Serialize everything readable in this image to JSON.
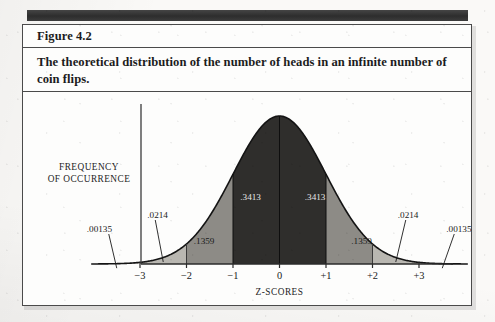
{
  "figure": {
    "title": "Figure 4.2",
    "caption": "The theoretical distribution of the number of heads in an infinite number of coin flips."
  },
  "chart_data": {
    "type": "area",
    "title": "The theoretical distribution of the number of heads in an infinite number of coin flips.",
    "xlabel": "Z-SCORES",
    "ylabel": "FREQUENCY OF OCCURRENCE",
    "ylabel_lines": [
      "FREQUENCY",
      "OF OCCURRENCE"
    ],
    "xlim": [
      -4,
      4
    ],
    "ylim": [
      0,
      0.42
    ],
    "grid": false,
    "legend": null,
    "distribution": "standard normal",
    "x_ticks": [
      "−3",
      "−2",
      "−1",
      "0",
      "+1",
      "+2",
      "+3"
    ],
    "x_tick_values": [
      -3,
      -2,
      -1,
      0,
      1,
      2,
      3
    ],
    "bands": [
      {
        "label": ".00135",
        "from": -4,
        "to": -3,
        "proportion": 0.00135,
        "shade": "#d8d6d0",
        "label_side": "outside"
      },
      {
        "label": ".0214",
        "from": -3,
        "to": -2,
        "proportion": 0.0214,
        "shade": "#b9b7b1",
        "label_side": "outside"
      },
      {
        "label": ".1359",
        "from": -2,
        "to": -1,
        "proportion": 0.1359,
        "shade": "#8d8b86",
        "label_side": "inside"
      },
      {
        "label": ".3413",
        "from": -1,
        "to": 0,
        "proportion": 0.3413,
        "shade": "#2f2e2c",
        "label_side": "inside-dark"
      },
      {
        "label": ".3413",
        "from": 0,
        "to": 1,
        "proportion": 0.3413,
        "shade": "#2f2e2c",
        "label_side": "inside-dark"
      },
      {
        "label": ".1359",
        "from": 1,
        "to": 2,
        "proportion": 0.1359,
        "shade": "#8d8b86",
        "label_side": "inside"
      },
      {
        "label": ".0214",
        "from": 2,
        "to": 3,
        "proportion": 0.0214,
        "shade": "#b9b7b1",
        "label_side": "outside"
      },
      {
        "label": ".00135",
        "from": 3,
        "to": 4,
        "proportion": 0.00135,
        "shade": "#d8d6d0",
        "label_side": "outside"
      }
    ],
    "annotations": [
      {
        "text": ".00135",
        "target_x": -3.5,
        "leader": true
      },
      {
        "text": ".0214",
        "target_x": -2.5,
        "leader": true
      },
      {
        "text": ".1359",
        "target_x": -1.5,
        "leader": false
      },
      {
        "text": ".3413",
        "target_x": -0.5,
        "leader": false
      },
      {
        "text": ".3413",
        "target_x": 0.5,
        "leader": false
      },
      {
        "text": ".1359",
        "target_x": 1.5,
        "leader": false
      },
      {
        "text": ".0214",
        "target_x": 2.5,
        "leader": true
      },
      {
        "text": ".00135",
        "target_x": 3.5,
        "leader": true
      }
    ],
    "colors": {
      "curve": "#141414",
      "axis": "#3b3b3b",
      "band_center": "#2f2e2c",
      "band_mid": "#8d8b86",
      "band_outer": "#b9b7b1",
      "band_tail": "#d8d6d0"
    }
  }
}
